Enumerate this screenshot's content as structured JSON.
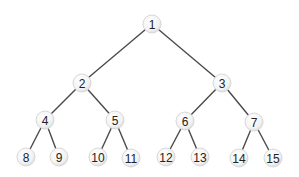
{
  "diagram": {
    "type": "binary-tree",
    "node_radius": 9,
    "colors": {
      "edge": "#4a4a4a",
      "node_fill": "#f4f4f4",
      "node_stroke": "#d8d8d8",
      "text": "#222222"
    },
    "nodes": [
      {
        "id": 1,
        "label": "1",
        "x": 152,
        "y": 24
      },
      {
        "id": 2,
        "label": "2",
        "x": 82,
        "y": 83
      },
      {
        "id": 3,
        "label": "3",
        "x": 222,
        "y": 83
      },
      {
        "id": 4,
        "label": "4",
        "x": 45,
        "y": 120
      },
      {
        "id": 5,
        "label": "5",
        "x": 115,
        "y": 120
      },
      {
        "id": 6,
        "label": "6",
        "x": 185,
        "y": 121
      },
      {
        "id": 7,
        "label": "7",
        "x": 254,
        "y": 122
      },
      {
        "id": 8,
        "label": "8",
        "x": 26,
        "y": 157
      },
      {
        "id": 9,
        "label": "9",
        "x": 59,
        "y": 157
      },
      {
        "id": 10,
        "label": "10",
        "x": 98,
        "y": 157
      },
      {
        "id": 11,
        "label": "11",
        "x": 131,
        "y": 158
      },
      {
        "id": 12,
        "label": "12",
        "x": 166,
        "y": 157
      },
      {
        "id": 13,
        "label": "13",
        "x": 200,
        "y": 157
      },
      {
        "id": 14,
        "label": "14",
        "x": 239,
        "y": 158
      },
      {
        "id": 15,
        "label": "15",
        "x": 273,
        "y": 158
      }
    ],
    "edges": [
      [
        1,
        2
      ],
      [
        1,
        3
      ],
      [
        2,
        4
      ],
      [
        2,
        5
      ],
      [
        3,
        6
      ],
      [
        3,
        7
      ],
      [
        4,
        8
      ],
      [
        4,
        9
      ],
      [
        5,
        10
      ],
      [
        5,
        11
      ],
      [
        6,
        12
      ],
      [
        6,
        13
      ],
      [
        7,
        14
      ],
      [
        7,
        15
      ]
    ]
  }
}
